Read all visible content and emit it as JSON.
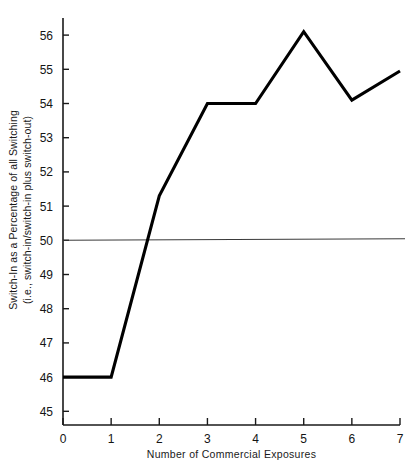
{
  "chart_data": {
    "type": "line",
    "title": "",
    "xlabel": "Number of Commercial Exposures",
    "ylabel_line1": "Switch-In as a Percentage of all Switching",
    "ylabel_line2": "(i.e., switch-in/switch-in plus switch-out)",
    "x": [
      0,
      1,
      2,
      3,
      4,
      5,
      6,
      7
    ],
    "values": [
      46,
      46,
      51.3,
      54,
      54,
      56.1,
      54.1,
      54.95
    ],
    "series": [
      {
        "name": "Switch-In Percentage",
        "values": [
          46,
          46,
          51.3,
          54,
          54,
          56.1,
          54.1,
          54.95
        ]
      }
    ],
    "xlim": [
      0,
      7
    ],
    "ylim": [
      44.6,
      56.5
    ],
    "xticks": [
      0,
      1,
      2,
      3,
      4,
      5,
      6,
      7
    ],
    "xtick_labels": [
      "0",
      "1",
      "2",
      "3",
      "4",
      "5",
      "6",
      "7"
    ],
    "yticks": [
      45,
      46,
      47,
      48,
      49,
      50,
      51,
      52,
      53,
      54,
      55,
      56
    ],
    "ytick_labels": [
      "45",
      "46",
      "47",
      "48",
      "49",
      "50",
      "51",
      "52",
      "53",
      "54",
      "55",
      "56"
    ],
    "reference_lines": [
      {
        "name": "fifty-percent-reference",
        "axis": "y",
        "value": 50,
        "label": "50"
      }
    ],
    "grid": false,
    "legend": null,
    "legend_position": "none",
    "annotations": []
  }
}
